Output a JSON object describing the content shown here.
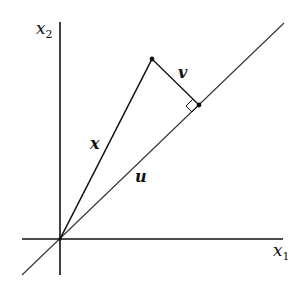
{
  "diagram": {
    "labels": {
      "x2_axis": "x",
      "x2_sub": "2",
      "x1_axis": "x",
      "x1_sub": "1",
      "vector_x": "x",
      "vector_u": "u",
      "vector_v": "v"
    },
    "colors": {
      "line": "#111111",
      "thin_line": "#333333",
      "background": "#ffffff"
    },
    "geometry": {
      "origin": [
        60,
        239
      ],
      "x_tip": [
        152,
        59
      ],
      "projection_point": [
        199,
        105
      ],
      "u_line_end": [
        284,
        23
      ],
      "u_line_start": [
        22,
        275
      ]
    }
  }
}
